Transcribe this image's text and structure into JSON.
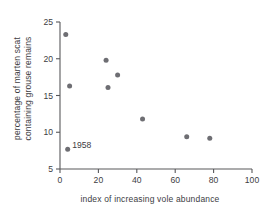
{
  "chart_data": {
    "type": "scatter",
    "title": "",
    "xlabel": "index of increasing vole abundance",
    "ylabel": "percentage of marten scat containing grouse remains",
    "ylabel_line1": "percentage of marten scat",
    "ylabel_line2": "containing grouse remains",
    "xlim": [
      0,
      100
    ],
    "ylim": [
      5,
      25
    ],
    "xticks": [
      0,
      20,
      40,
      60,
      80,
      100
    ],
    "yticks": [
      5,
      10,
      15,
      20,
      25
    ],
    "xtick_labels": [
      "0",
      "20",
      "40",
      "60",
      "80",
      "100"
    ],
    "ytick_labels": [
      "5",
      "10",
      "15",
      "20",
      "25"
    ],
    "grid": false,
    "legend": "none",
    "point_color": "#6e6e73",
    "axis_color": "#58585b",
    "text_color": "#3d3d3f",
    "background": "#ffffff",
    "points": [
      {
        "x": 3,
        "y": 23.3,
        "label": ""
      },
      {
        "x": 5,
        "y": 16.3,
        "label": ""
      },
      {
        "x": 4,
        "y": 7.7,
        "label": "1958"
      },
      {
        "x": 24,
        "y": 19.8,
        "label": ""
      },
      {
        "x": 30,
        "y": 17.8,
        "label": ""
      },
      {
        "x": 25,
        "y": 16.1,
        "label": ""
      },
      {
        "x": 43,
        "y": 11.8,
        "label": ""
      },
      {
        "x": 66,
        "y": 9.4,
        "label": ""
      },
      {
        "x": 78,
        "y": 9.2,
        "label": ""
      }
    ],
    "annotations": [
      {
        "text": "1958",
        "x": 4,
        "y": 7.7
      }
    ]
  }
}
